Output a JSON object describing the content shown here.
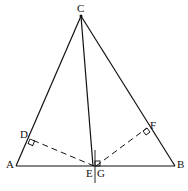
{
  "figure": {
    "type": "geometry",
    "points": {
      "A": {
        "label": "A",
        "x": 16,
        "y": 166
      },
      "B": {
        "label": "B",
        "x": 175,
        "y": 166
      },
      "C": {
        "label": "C",
        "x": 81,
        "y": 16
      },
      "D": {
        "label": "D",
        "x": 30,
        "y": 139
      },
      "E": {
        "label": "E",
        "x": 94,
        "y": 166
      },
      "F": {
        "label": "F",
        "x": 147,
        "y": 128
      },
      "G": {
        "label": "G",
        "x": 96,
        "y": 166
      }
    },
    "segments": [
      {
        "from": "A",
        "to": "B",
        "style": "solid"
      },
      {
        "from": "A",
        "to": "C",
        "style": "solid"
      },
      {
        "from": "B",
        "to": "C",
        "style": "solid"
      },
      {
        "from": "C",
        "to": "E",
        "style": "solid"
      },
      {
        "from": "G",
        "to": "D",
        "style": "dashed"
      },
      {
        "from": "G",
        "to": "F",
        "style": "dashed"
      }
    ],
    "right_angles": [
      "D",
      "F",
      "G"
    ],
    "caption": ""
  },
  "colors": {
    "stroke": "#111111",
    "background": "#ffffff"
  }
}
